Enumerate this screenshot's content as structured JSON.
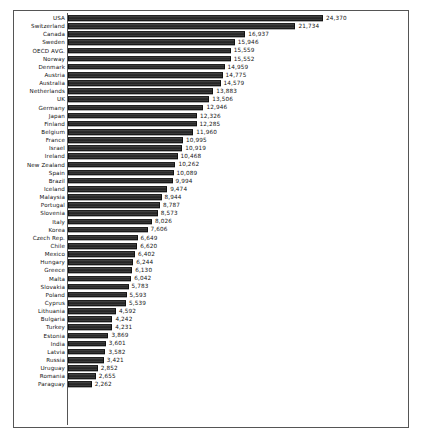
{
  "chart_data": {
    "type": "bar",
    "orientation": "horizontal",
    "title": "",
    "subtitle": "",
    "xlabel": "",
    "ylabel": "",
    "grid": false,
    "legend": false,
    "data_labels": true,
    "sorted": "descending",
    "xlim": [
      0,
      24370
    ],
    "categories": [
      "USA",
      "Switzerland",
      "Canada",
      "Sweden",
      "OECD AVG.",
      "Norway",
      "Denmark",
      "Austria",
      "Australia",
      "Netherlands",
      "UK",
      "Germany",
      "Japan",
      "Finland",
      "Belgium",
      "France",
      "Israel",
      "Ireland",
      "New Zealand",
      "Spain",
      "Brazil",
      "Iceland",
      "Malaysia",
      "Portugal",
      "Slovenia",
      "Italy",
      "Korea",
      "Czech Rep.",
      "Chile",
      "Mexico",
      "Hungary",
      "Greece",
      "Malta",
      "Slovakia",
      "Poland",
      "Cyprus",
      "Lithuania",
      "Bulgaria",
      "Turkey",
      "Estonia",
      "India",
      "Latvia",
      "Russia",
      "Uruguay",
      "Romania",
      "Paraguay"
    ],
    "values": [
      24370,
      21734,
      16937,
      15946,
      15559,
      15552,
      14959,
      14775,
      14579,
      13883,
      13506,
      12946,
      12326,
      12285,
      11960,
      10995,
      10919,
      10468,
      10262,
      10089,
      9994,
      9474,
      8944,
      8787,
      8573,
      8026,
      7606,
      6649,
      6620,
      6402,
      6244,
      6130,
      6042,
      5783,
      5593,
      5539,
      4592,
      4242,
      4231,
      3869,
      3601,
      3582,
      3421,
      2852,
      2655,
      2262
    ],
    "value_labels": [
      "24,370",
      "21,734",
      "16,937",
      "15,946",
      "15,559",
      "15,552",
      "14,959",
      "14,775",
      "14,579",
      "13,883",
      "13,506",
      "12,946",
      "12,326",
      "12,285",
      "11,960",
      "10,995",
      "10,919",
      "10,468",
      "10,262",
      "10,089",
      "9,994",
      "9,474",
      "8,944",
      "8,787",
      "8,573",
      "8,026",
      "7,606",
      "6,649",
      "6,620",
      "6,402",
      "6,244",
      "6,130",
      "6,042",
      "5,783",
      "5,593",
      "5,539",
      "4,592",
      "4,242",
      "4,231",
      "3,869",
      "3,601",
      "3,582",
      "3,421",
      "2,852",
      "2,655",
      "2,262"
    ]
  },
  "colors": {
    "bar": "#3a3a3a",
    "bar_edge": "#111111",
    "frame": "#555555",
    "text": "#111111",
    "background": "#ffffff"
  },
  "source_note": ""
}
